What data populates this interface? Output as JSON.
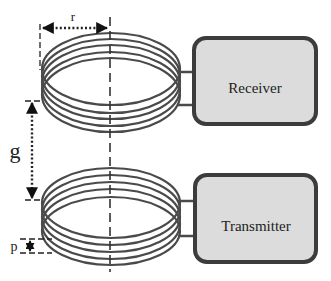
{
  "diagram": {
    "type": "coupled-coil-wireless-link",
    "blocks": {
      "receiver": {
        "label": "Receiver"
      },
      "transmitter": {
        "label": "Transmitter"
      }
    },
    "dimensions": {
      "radius": {
        "label": "r"
      },
      "gap": {
        "label": "g"
      },
      "pitch": {
        "label": "p"
      }
    },
    "coils": [
      {
        "name": "receiver-coil",
        "turns": 5
      },
      {
        "name": "transmitter-coil",
        "turns": 5
      }
    ],
    "colors": {
      "stroke": "#4a4a4a",
      "box_fill": "#dcdcdc",
      "box_border": "#3c3c3c"
    }
  }
}
